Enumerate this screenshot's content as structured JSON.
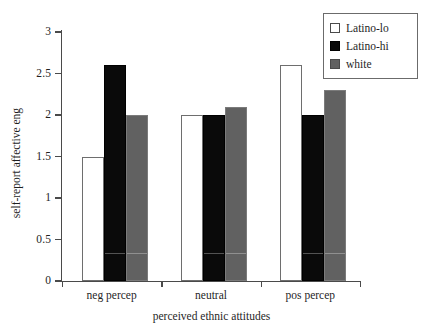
{
  "chart_data": {
    "type": "bar",
    "title": "",
    "subtitle": "",
    "xlabel": "perceived ethnic attitudes",
    "ylabel": "self-report affective eng",
    "categories": [
      "neg percep",
      "neutral",
      "pos percep"
    ],
    "series": [
      {
        "name": "Latino-lo",
        "color": "#ffffff",
        "values": [
          1.5,
          2.0,
          2.6
        ]
      },
      {
        "name": "Latino-hi",
        "color": "#0a0a0a",
        "values": [
          2.6,
          2.0,
          2.0
        ]
      },
      {
        "name": "white",
        "color": "#616161",
        "values": [
          2.0,
          2.1,
          2.3
        ]
      }
    ],
    "ylim": [
      0,
      3
    ],
    "yticks": [
      "0",
      "0.5",
      "1",
      "1.5",
      "2",
      "2.5",
      "3"
    ],
    "ytick_values": [
      0,
      0.5,
      1,
      1.5,
      2,
      2.5,
      3
    ],
    "grid": false,
    "legend_position": "top-right",
    "legend_entries": [
      "Latino-lo",
      "Latino-hi",
      "white"
    ]
  }
}
